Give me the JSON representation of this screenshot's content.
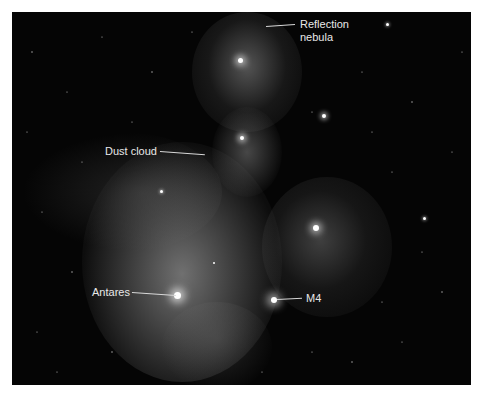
{
  "image": {
    "description": "Grayscale astrophotograph of the Rho Ophiuchi cloud complex with annotations",
    "border_color": "#ffffff",
    "sky_color": "#050505"
  },
  "annotations": [
    {
      "id": "reflection-nebula",
      "text": "Reflection\nnebula",
      "label_x": 300,
      "label_y": 18,
      "line": {
        "x1": 266,
        "y1": 27,
        "x2": 295,
        "y2": 24
      }
    },
    {
      "id": "dust-cloud",
      "text": "Dust cloud",
      "label_x": 105,
      "label_y": 146,
      "line": {
        "x1": 160,
        "y1": 151,
        "x2": 205,
        "y2": 154
      }
    },
    {
      "id": "antares",
      "text": "Antares",
      "label_x": 92,
      "label_y": 286,
      "line": {
        "x1": 132,
        "y1": 292,
        "x2": 176,
        "y2": 295
      }
    },
    {
      "id": "m4",
      "text": "M4",
      "label_x": 306,
      "label_y": 292,
      "line": {
        "x1": 277,
        "y1": 300,
        "x2": 302,
        "y2": 298
      }
    }
  ],
  "bright_objects": [
    {
      "name": "Antares",
      "x": 177,
      "y": 295,
      "size": 7
    },
    {
      "name": "M4",
      "x": 274,
      "y": 300,
      "size": 6
    },
    {
      "name": "reflection-nebula-star",
      "x": 240,
      "y": 60,
      "size": 5
    },
    {
      "name": "nebula-star-right",
      "x": 316,
      "y": 228,
      "size": 6
    },
    {
      "name": "nebula-star-mid",
      "x": 242,
      "y": 138,
      "size": 4
    },
    {
      "name": "star-upper-right",
      "x": 324,
      "y": 116,
      "size": 4
    },
    {
      "name": "star-far-right",
      "x": 424,
      "y": 218,
      "size": 3
    },
    {
      "name": "star-top-right",
      "x": 387,
      "y": 24,
      "size": 3
    },
    {
      "name": "star-left-cluster",
      "x": 161,
      "y": 191,
      "size": 3
    },
    {
      "name": "star-mid",
      "x": 214,
      "y": 263,
      "size": 2
    }
  ]
}
